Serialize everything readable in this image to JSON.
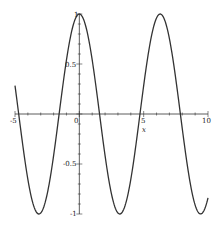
{
  "chart_data": {
    "type": "line",
    "title": "",
    "xlabel": "x",
    "ylabel": "",
    "xlim": [
      -5,
      10
    ],
    "ylim": [
      -1,
      1
    ],
    "grid": false,
    "legend": null,
    "x_ticks": [
      -5,
      0,
      5,
      10
    ],
    "x_tick_labels": [
      "-5",
      "0",
      "5",
      "10"
    ],
    "y_ticks": [
      -1,
      -0.5,
      0.5,
      1
    ],
    "y_tick_labels": [
      "-1",
      "-0.5",
      "0.5",
      "1"
    ],
    "series": [
      {
        "name": "cos(x)",
        "color": "#333333",
        "x": [
          -5,
          -4,
          -3.1416,
          -2,
          -1.5708,
          -1,
          0,
          1,
          1.5708,
          2,
          3.1416,
          4,
          4.7124,
          5,
          6,
          6.2832,
          7,
          7.854,
          8,
          9,
          9.4248,
          10
        ],
        "y": [
          0.284,
          -0.654,
          -1,
          -0.416,
          0,
          0.54,
          1,
          0.54,
          0,
          -0.416,
          -1,
          -0.654,
          0,
          0.284,
          0.96,
          1,
          0.754,
          0,
          -0.146,
          -0.911,
          -1,
          -0.839
        ]
      }
    ]
  },
  "axes": {
    "x_label": "x",
    "x_tick_labels": [
      "-5",
      "0",
      "5",
      "10"
    ],
    "y_tick_labels": [
      "1",
      "0.5",
      "-0.5",
      "-1"
    ]
  }
}
